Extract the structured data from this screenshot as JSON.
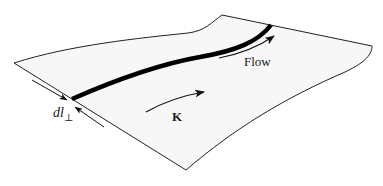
{
  "figure": {
    "labels": {
      "flow": "Flow",
      "k_vector": "K",
      "dl_main": "dl",
      "dl_subscript": "⊥"
    },
    "colors": {
      "sheet_fill": "#f7f7f7",
      "outline": "#222222",
      "current_line": "#000000",
      "background": "#ffffff"
    }
  }
}
